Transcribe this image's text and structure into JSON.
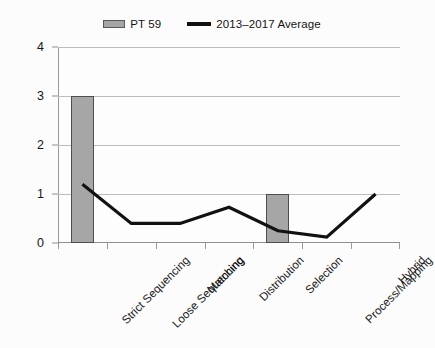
{
  "legend": {
    "position": "top-center",
    "items": [
      {
        "label": "PT 59",
        "type": "bar",
        "color": "#A6A6A6"
      },
      {
        "label": "2013–2017 Average",
        "type": "line",
        "color": "#111111"
      }
    ]
  },
  "axes": {
    "y_ticks": [
      "0",
      "1",
      "2",
      "3",
      "4"
    ],
    "x_categories": [
      "Strict Sequencing",
      "Loose Sequencing",
      "Matching",
      "Distribution",
      "Selection",
      "Process/Mapping",
      "Hybrid"
    ]
  },
  "chart_data": {
    "type": "bar",
    "title": "",
    "subtitle": "",
    "xlabel": "",
    "ylabel": "",
    "ylim": [
      0,
      4
    ],
    "yticks": [
      0,
      1,
      2,
      3,
      4
    ],
    "grid": true,
    "legend_position": "top-center",
    "categories": [
      "Strict Sequencing",
      "Loose Sequencing",
      "Matching",
      "Distribution",
      "Selection",
      "Process/Mapping",
      "Hybrid"
    ],
    "series": [
      {
        "name": "PT 59",
        "type": "bar",
        "color": "#A6A6A6",
        "edge_color": "#4D4D4D",
        "values": [
          3,
          0,
          0,
          0,
          1,
          0,
          0
        ]
      },
      {
        "name": "2013–2017 Average",
        "type": "line",
        "color": "#111111",
        "line_width": 3,
        "values": [
          1.2,
          0.4,
          0.4,
          0.73,
          0.25,
          0.12,
          1.0
        ]
      }
    ]
  }
}
